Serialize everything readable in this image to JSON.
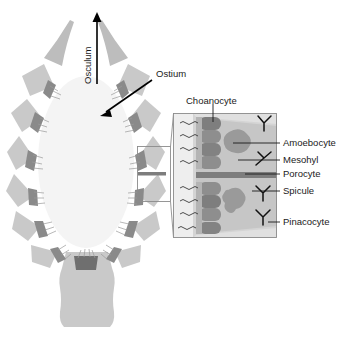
{
  "colors": {
    "background": "#ffffff",
    "spongue_wedge": "#c9c9c9",
    "wedge_dark_band": "#8a8a8a",
    "spongocoel_interior": "#f2f2f2",
    "inset_mesohyl": "#c6c6c6",
    "inset_light": "#e3e3e3",
    "choanocyte": "#8e8e8e",
    "choanocyte_dark": "#7a7a7a",
    "amoebocyte": "#9a9a9a",
    "porocyte": "#7d7d7d",
    "spicule": "#111111",
    "text": "#1a1a1a",
    "leader_line": "#1a1a1a",
    "inset_border": "#8c8c8c"
  },
  "labels": {
    "osculum": "Osculum",
    "ostium": "Ostium",
    "choanocyte": "Choanocyte",
    "amoebocyte": "Amoebocyte",
    "mesohyl": "Mesohyl",
    "porocyte": "Porocyte",
    "spicule": "Spicule",
    "pinacocyte": "Pinacocyte"
  },
  "label_positions": {
    "osculum": {
      "x": 85,
      "y": 70,
      "rotation": -90
    },
    "ostium": {
      "x": 158,
      "y": 74
    },
    "choanocyte": {
      "x": 185,
      "y": 100
    },
    "amoebocyte": {
      "x": 283,
      "y": 143
    },
    "mesohyl": {
      "x": 283,
      "y": 160
    },
    "porocyte": {
      "x": 283,
      "y": 173
    },
    "spicule": {
      "x": 283,
      "y": 191
    },
    "pinacocyte": {
      "x": 283,
      "y": 222
    }
  },
  "structures": {
    "osculum_arrow": {
      "from_y": 82,
      "to_y": 14,
      "x": 97,
      "direction": "up"
    },
    "ostium_arrow": {
      "from": [
        153,
        80
      ],
      "to": [
        101,
        115
      ]
    },
    "inset_box": {
      "x": 173,
      "y": 113,
      "width": 104,
      "height": 125
    },
    "callout_box": {
      "x": 137,
      "y": 146,
      "width": 34,
      "height": 56
    },
    "sponge_body": {
      "center_x": 86,
      "center_y": 160,
      "radius_x": 76,
      "radius_y": 110
    },
    "wedge_count": 18,
    "choanocyte_count": 9,
    "spicule_count": 4,
    "amoebocyte_count": 2
  }
}
